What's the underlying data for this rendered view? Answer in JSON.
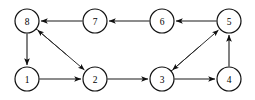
{
  "figure": {
    "name": "directed-graph",
    "width": 255,
    "height": 100,
    "background_color": "#ffffff",
    "node_fill_color": "#ffffff",
    "node_stroke_color": "#111111",
    "edge_color": "#1a1a1a",
    "label_color": "#000000",
    "node_radius": 12
  },
  "nodes": [
    {
      "id": "8",
      "label": "8",
      "cx": 27,
      "cy": 21
    },
    {
      "id": "7",
      "label": "7",
      "cx": 95,
      "cy": 21
    },
    {
      "id": "6",
      "label": "6",
      "cx": 162,
      "cy": 21
    },
    {
      "id": "5",
      "label": "5",
      "cx": 229,
      "cy": 21
    },
    {
      "id": "1",
      "label": "1",
      "cx": 27,
      "cy": 79
    },
    {
      "id": "2",
      "label": "2",
      "cx": 95,
      "cy": 79
    },
    {
      "id": "3",
      "label": "3",
      "cx": 162,
      "cy": 79
    },
    {
      "id": "4",
      "label": "4",
      "cx": 229,
      "cy": 79
    }
  ],
  "edges": [
    {
      "id": "e-8-1",
      "from": "8",
      "to": "1",
      "directed": "one-way",
      "kind": "vertical"
    },
    {
      "id": "e-1-2",
      "from": "1",
      "to": "2",
      "directed": "one-way",
      "kind": "horizontal"
    },
    {
      "id": "e-2-3",
      "from": "2",
      "to": "3",
      "directed": "one-way",
      "kind": "horizontal"
    },
    {
      "id": "e-3-4",
      "from": "3",
      "to": "4",
      "directed": "one-way",
      "kind": "horizontal"
    },
    {
      "id": "e-4-5",
      "from": "4",
      "to": "5",
      "directed": "one-way",
      "kind": "vertical"
    },
    {
      "id": "e-5-6",
      "from": "5",
      "to": "6",
      "directed": "one-way",
      "kind": "horizontal"
    },
    {
      "id": "e-6-7",
      "from": "6",
      "to": "7",
      "directed": "one-way",
      "kind": "horizontal"
    },
    {
      "id": "e-7-8",
      "from": "7",
      "to": "8",
      "directed": "one-way",
      "kind": "horizontal"
    },
    {
      "id": "e-8-2",
      "from": "8",
      "to": "2",
      "directed": "bidirectional",
      "kind": "diagonal"
    },
    {
      "id": "e-3-5",
      "from": "3",
      "to": "5",
      "directed": "bidirectional",
      "kind": "diagonal"
    }
  ]
}
